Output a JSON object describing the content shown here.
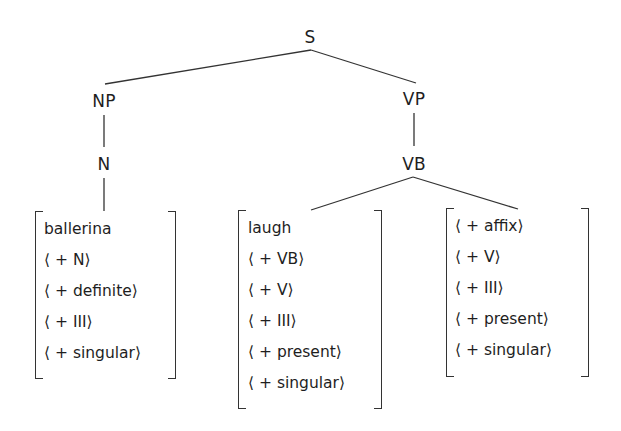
{
  "tree": {
    "nodes": {
      "s": "S",
      "np": "NP",
      "vp": "VP",
      "n": "N",
      "vb": "VB"
    },
    "edges": [
      [
        "S",
        "NP"
      ],
      [
        "S",
        "VP"
      ],
      [
        "NP",
        "N"
      ],
      [
        "VP",
        "VB"
      ],
      [
        "N",
        "ballerina-matrix"
      ],
      [
        "VB",
        "laugh-matrix"
      ],
      [
        "VB",
        "affix-matrix"
      ]
    ]
  },
  "matrices": {
    "ballerina": [
      "ballerina",
      "⟨ + N⟩",
      "⟨ + definite⟩",
      "⟨ + III⟩",
      "⟨ + singular⟩"
    ],
    "laugh": [
      "laugh",
      "⟨ + VB⟩",
      "⟨ + V⟩",
      "⟨ + III⟩",
      "⟨ + present⟩",
      "⟨ + singular⟩"
    ],
    "affix": [
      "⟨ + affix⟩",
      "⟨ + V⟩",
      "⟨ + III⟩",
      "⟨ + present⟩",
      "⟨ + singular⟩"
    ]
  },
  "colors": {
    "ink": "#1e1e1e",
    "line": "#333333",
    "background": "#ffffff"
  }
}
